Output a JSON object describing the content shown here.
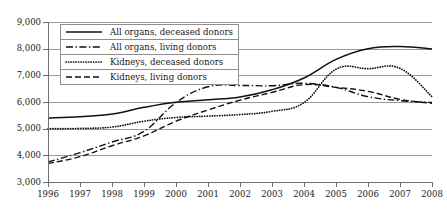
{
  "chart_data": {
    "type": "line",
    "title": "",
    "xlabel": "",
    "ylabel": "",
    "x": [
      1996,
      1997,
      1998,
      1999,
      2000,
      2001,
      2002,
      2003,
      2004,
      2005,
      2006,
      2007,
      2008
    ],
    "xtick_labels": [
      "1996",
      "1997",
      "1998",
      "1999",
      "2000",
      "2001",
      "2002",
      "2003",
      "2004",
      "2005",
      "2006",
      "2007",
      "2008"
    ],
    "ytick_labels": [
      "3,000",
      "4,000",
      "5,000",
      "6,000",
      "7,000",
      "8,000",
      "9,000"
    ],
    "ytick_values": [
      3000,
      4000,
      5000,
      6000,
      7000,
      8000,
      9000
    ],
    "ylim": [
      3000,
      9000
    ],
    "grid": "horizontal",
    "legend_position": "upper-left-inside",
    "series": [
      {
        "name": "All organs, deceased donors",
        "style": "solid",
        "values": [
          5400,
          5450,
          5550,
          5800,
          5990,
          6080,
          6190,
          6460,
          6900,
          7600,
          8000,
          8080,
          7990
        ]
      },
      {
        "name": "All organs, living donors",
        "style": "dash-dot",
        "values": [
          3750,
          4100,
          4500,
          4900,
          5980,
          6570,
          6620,
          6610,
          6700,
          6550,
          6200,
          6050,
          5980
        ]
      },
      {
        "name": "Kidneys, deceased donors",
        "style": "dotted",
        "values": [
          5000,
          5010,
          5060,
          5280,
          5420,
          5470,
          5530,
          5650,
          5980,
          7230,
          7250,
          7260,
          6200
        ]
      },
      {
        "name": "Kidneys, living donors",
        "style": "dashed",
        "values": [
          3690,
          3950,
          4360,
          4730,
          5280,
          5700,
          6070,
          6360,
          6650,
          6550,
          6400,
          6100,
          5950
        ]
      }
    ]
  },
  "legend": {
    "items": [
      {
        "label": "All organs, deceased donors",
        "style": "solid"
      },
      {
        "label": "All organs, living donors",
        "style": "dash-dot"
      },
      {
        "label": "Kidneys, deceased donors",
        "style": "dotted"
      },
      {
        "label": "Kidneys, living donors",
        "style": "dashed"
      }
    ]
  },
  "colors": {
    "line": "#111111",
    "grid": "#9a9a9a",
    "axis": "#6f6f6f",
    "text": "#1a1a1a",
    "background": "#ffffff"
  }
}
